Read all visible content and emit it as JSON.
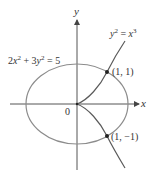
{
  "figure": {
    "axes": {
      "x_label": "x",
      "y_label": "y",
      "origin_label": "0"
    },
    "equations": {
      "ellipse": {
        "coef_x": "2",
        "var_x": "x",
        "exp_x": "2",
        "plus": " + ",
        "coef_y": "3",
        "var_y": "y",
        "exp_y": "2",
        "equals_rhs": " = 5"
      },
      "curve": {
        "var_y": "y",
        "exp_y": "2",
        "equals": " = ",
        "var_x": "x",
        "exp_x": "3"
      }
    },
    "points": [
      {
        "label": "(1, 1)"
      },
      {
        "label": "(1, −1)"
      }
    ],
    "colors": {
      "ellipse": "#8c8c8c",
      "curve": "#5a5a5a",
      "axes": "#555555",
      "points": "#222222",
      "text": "#333333"
    }
  }
}
